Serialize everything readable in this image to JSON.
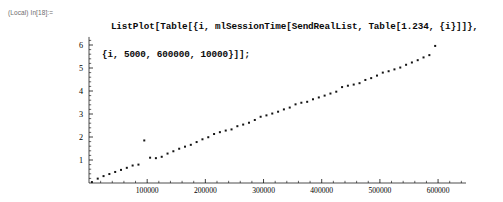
{
  "notebook": {
    "input_label": "(Local) In[18]:=",
    "code_line_1": "ListPlot[Table[{i, mlSessionTime[SendRealList, Table[1.234, {i}]]},",
    "code_line_2": "{i, 5000, 600000, 10000}]];"
  },
  "colors": {
    "text": "#0a0a0a",
    "label": "#6d6d6d",
    "axis": "#000000",
    "marker": "#141414",
    "background": "#ffffff"
  },
  "chart_data": {
    "type": "scatter",
    "title": "",
    "xlabel": "",
    "ylabel": "",
    "xlim": [
      0,
      648000
    ],
    "ylim": [
      0,
      6.35
    ],
    "grid": false,
    "legend": "none",
    "marker_style": "square",
    "marker_size_px": 2,
    "xticks": [
      100000,
      200000,
      300000,
      400000,
      500000,
      600000
    ],
    "xtick_labels": [
      "100000",
      "200000",
      "300000",
      "400000",
      "500000",
      "600000"
    ],
    "yticks": [
      1,
      2,
      3,
      4,
      5,
      6
    ],
    "ytick_labels": [
      "1",
      "2",
      "3",
      "4",
      "5",
      "6"
    ],
    "x_minor_step": 20000,
    "y_minor_step": 0.2,
    "x": [
      5000,
      15000,
      25000,
      35000,
      45000,
      55000,
      65000,
      75000,
      85000,
      95000,
      105000,
      115000,
      125000,
      135000,
      145000,
      155000,
      165000,
      175000,
      185000,
      195000,
      205000,
      215000,
      225000,
      235000,
      245000,
      255000,
      265000,
      275000,
      285000,
      295000,
      305000,
      315000,
      325000,
      335000,
      345000,
      355000,
      365000,
      375000,
      385000,
      395000,
      405000,
      415000,
      425000,
      435000,
      445000,
      455000,
      465000,
      475000,
      485000,
      495000,
      505000,
      515000,
      525000,
      535000,
      545000,
      555000,
      565000,
      575000,
      585000,
      595000
    ],
    "y": [
      0.04,
      0.19,
      0.3,
      0.39,
      0.48,
      0.57,
      0.66,
      0.76,
      0.8,
      1.85,
      1.1,
      1.08,
      1.14,
      1.28,
      1.38,
      1.49,
      1.58,
      1.66,
      1.78,
      1.9,
      1.99,
      2.13,
      2.21,
      2.28,
      2.33,
      2.47,
      2.54,
      2.62,
      2.74,
      2.88,
      2.94,
      3.02,
      3.1,
      3.2,
      3.28,
      3.42,
      3.49,
      3.53,
      3.64,
      3.72,
      3.8,
      3.89,
      3.97,
      4.17,
      4.23,
      4.28,
      4.34,
      4.48,
      4.56,
      4.67,
      4.8,
      4.86,
      4.94,
      5.02,
      5.14,
      5.24,
      5.34,
      5.46,
      5.56,
      5.96
    ],
    "annotations": [
      {
        "label": "outlier",
        "x": 95000,
        "y": 1.85
      }
    ]
  }
}
